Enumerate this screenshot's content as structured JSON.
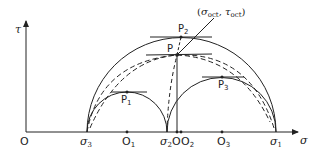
{
  "diagram": {
    "axes": {
      "x_label": "σ",
      "y_label": "τ",
      "origin_label": "O"
    },
    "axis_points": [
      {
        "id": "sigma3",
        "label": "σ",
        "sub": "3",
        "x": 87
      },
      {
        "id": "O1",
        "label": "O",
        "sub": "1",
        "x": 127
      },
      {
        "id": "sigma2",
        "label": "σ",
        "sub": "2",
        "x": 167
      },
      {
        "id": "O",
        "label": "O",
        "sub": "",
        "x": 177
      },
      {
        "id": "O2",
        "label": "O",
        "sub": "2",
        "x": 181
      },
      {
        "id": "O3",
        "label": "O",
        "sub": "3",
        "x": 222
      },
      {
        "id": "sigma1",
        "label": "σ",
        "sub": "1",
        "x": 276
      }
    ],
    "points": [
      {
        "id": "P",
        "label": "P",
        "sub": ""
      },
      {
        "id": "P1",
        "label": "P",
        "sub": "1"
      },
      {
        "id": "P2",
        "label": "P",
        "sub": "2"
      },
      {
        "id": "P3",
        "label": "P",
        "sub": "3"
      }
    ],
    "annotation": {
      "text_open": "(",
      "sigma": "σ",
      "sigma_sub": "oct",
      "comma": ", ",
      "tau": "τ",
      "tau_sub": "oct",
      "text_close": ")"
    },
    "circles": [
      {
        "name": "outer-circle",
        "from": "σ3",
        "to": "σ1",
        "style": "solid"
      },
      {
        "name": "circle-1",
        "from": "σ3",
        "to": "σ2",
        "style": "solid"
      },
      {
        "name": "circle-3",
        "from": "σ2",
        "to": "σ1",
        "style": "solid"
      }
    ],
    "colors": {
      "line": "#222222",
      "background": "#ffffff"
    }
  }
}
